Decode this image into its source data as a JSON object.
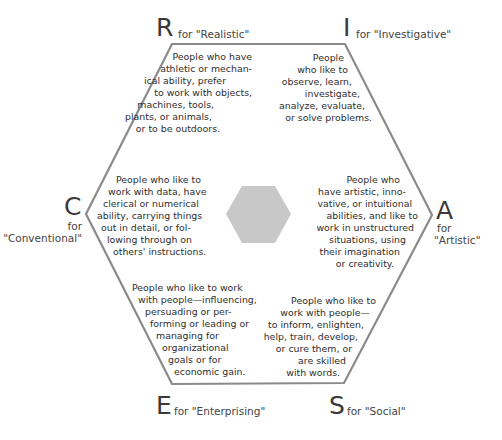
{
  "colors": {
    "outline": "#8a8a8a",
    "center_hexagon": "#c8c8c8",
    "text": "#2e2e2e"
  },
  "types": {
    "R": {
      "letter": "R",
      "label": "for \"Realistic\"",
      "lines": [
        "People who have",
        "athletic or mechan-",
        "ical ability, prefer",
        "to work with objects,",
        "machines, tools,",
        "plants, or animals,",
        "or to be outdoors."
      ]
    },
    "I": {
      "letter": "I",
      "label": "for \"Investigative\"",
      "lines": [
        "People",
        "who like to",
        "observe, learn,",
        "investigate,",
        "analyze, evaluate,",
        "or solve problems."
      ]
    },
    "A": {
      "letter": "A",
      "label_line1": "for",
      "label_line2": "\"Artistic\"",
      "lines": [
        "People who",
        "have artistic, inno-",
        "vative, or intuitional",
        "abilities, and like to",
        "work in unstructured",
        "situations, using",
        "their imagination",
        "or creativity."
      ]
    },
    "S": {
      "letter": "S",
      "label": "for \"Social\"",
      "lines": [
        "People who like to",
        "work with people—",
        "to inform, enlighten,",
        "help, train, develop,",
        "or cure them, or",
        "are skilled",
        "with words."
      ]
    },
    "E": {
      "letter": "E",
      "label": "for \"Enterprising\"",
      "lines": [
        "People who like to work",
        "with people—influencing,",
        "persuading or per-",
        "forming or leading or",
        "managing for",
        "organizational",
        "goals or for",
        "economic gain."
      ]
    },
    "C": {
      "letter": "C",
      "label_line1": "for",
      "label_line2": "\"Conventional\"",
      "lines": [
        "People who like to",
        "work with data, have",
        "clerical or numerical",
        "ability, carrying things",
        "out in detail, or fol-",
        "lowing through on",
        "others' instructions."
      ]
    }
  }
}
